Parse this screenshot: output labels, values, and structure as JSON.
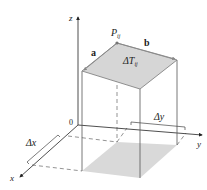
{
  "diagram": {
    "colors": {
      "line": "#555555",
      "shade": "#d9d9d9",
      "point": "#777777",
      "text": "#222222"
    },
    "axes": {
      "x_label": "x",
      "y_label": "y",
      "z_label": "z",
      "origin_label": "0"
    },
    "labels": {
      "point": "P",
      "point_sub": "ij",
      "vector_a": "a",
      "vector_b": "b",
      "patch": "ΔT",
      "patch_sub": "ij",
      "delta_x": "Δx",
      "delta_y": "Δy"
    }
  }
}
